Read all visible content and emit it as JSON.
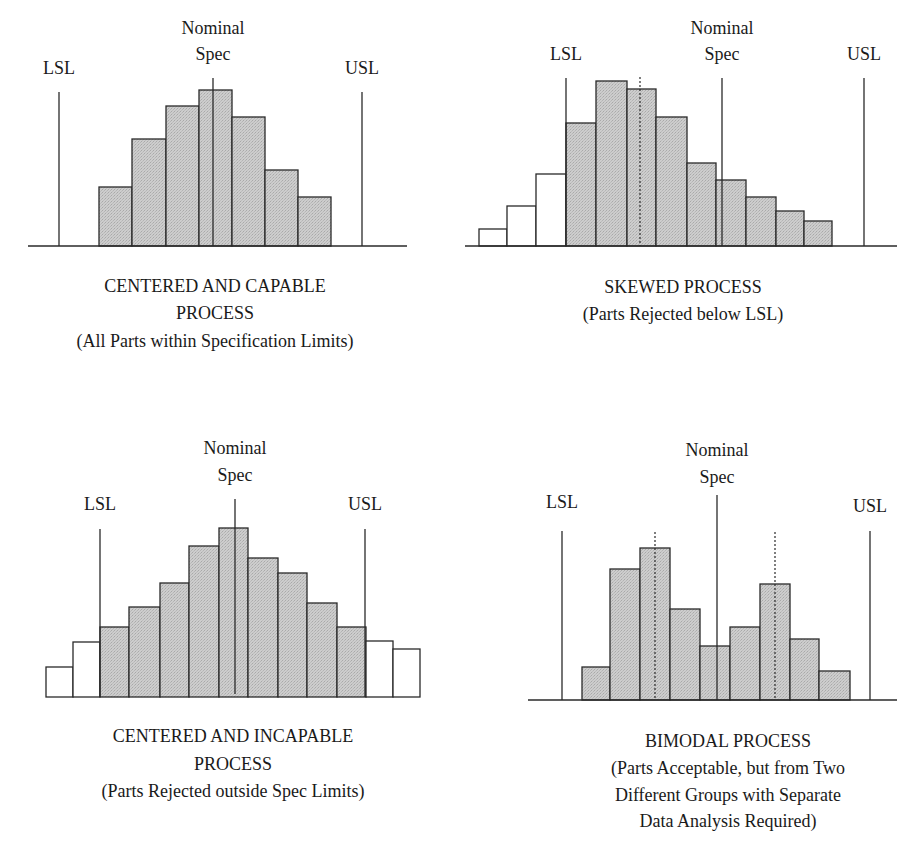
{
  "colors": {
    "fill_in_spec": "#c9c9c9",
    "fill_rejected": "#ffffff",
    "stroke": "#2a2a2a"
  },
  "labels": {
    "lsl": "LSL",
    "usl": "USL",
    "nominal_line1": "Nominal",
    "nominal_line2": "Spec"
  },
  "chart_data": [
    {
      "type": "bar",
      "title": "CENTERED AND CAPABLE PROCESS",
      "caption": [
        "CENTERED AND CAPABLE",
        "PROCESS",
        "(All Parts within Specification Limits)"
      ],
      "spec_lines": {
        "LSL": 59,
        "Nominal": 213,
        "USL": 362
      },
      "bars": [
        {
          "x0": 99,
          "x1": 132,
          "top": 187,
          "rejected": false
        },
        {
          "x0": 132,
          "x1": 166,
          "top": 139,
          "rejected": false
        },
        {
          "x0": 166,
          "x1": 199,
          "top": 106,
          "rejected": false
        },
        {
          "x0": 199,
          "x1": 232,
          "top": 90,
          "rejected": false
        },
        {
          "x0": 232,
          "x1": 265,
          "top": 117,
          "rejected": false
        },
        {
          "x0": 265,
          "x1": 298,
          "top": 170,
          "rejected": false
        },
        {
          "x0": 298,
          "x1": 331,
          "top": 197,
          "rejected": false
        }
      ],
      "relative_heights": [
        59,
        107,
        140,
        156,
        129,
        76,
        49
      ],
      "dotted_lines": []
    },
    {
      "type": "bar",
      "title": "SKEWED PROCESS",
      "caption": [
        "SKEWED PROCESS",
        "(Parts Rejected below LSL)"
      ],
      "spec_lines": {
        "LSL": 566,
        "Nominal": 722,
        "USL": 864
      },
      "bars": [
        {
          "x0": 479,
          "x1": 507,
          "top": 229,
          "rejected": true
        },
        {
          "x0": 507,
          "x1": 536,
          "top": 206,
          "rejected": true
        },
        {
          "x0": 536,
          "x1": 566,
          "top": 174,
          "rejected": true
        },
        {
          "x0": 566,
          "x1": 596,
          "top": 123,
          "rejected": false
        },
        {
          "x0": 596,
          "x1": 627,
          "top": 81,
          "rejected": false
        },
        {
          "x0": 627,
          "x1": 656,
          "top": 89,
          "rejected": false
        },
        {
          "x0": 656,
          "x1": 687,
          "top": 117,
          "rejected": false
        },
        {
          "x0": 687,
          "x1": 716,
          "top": 163,
          "rejected": false
        },
        {
          "x0": 716,
          "x1": 746,
          "top": 180,
          "rejected": false
        },
        {
          "x0": 746,
          "x1": 776,
          "top": 197,
          "rejected": false
        },
        {
          "x0": 776,
          "x1": 804,
          "top": 211,
          "rejected": false
        },
        {
          "x0": 804,
          "x1": 832,
          "top": 221,
          "rejected": false
        }
      ],
      "relative_heights": [
        17,
        40,
        72,
        123,
        165,
        157,
        129,
        83,
        66,
        49,
        35,
        25
      ],
      "dotted_lines": [
        640
      ]
    },
    {
      "type": "bar",
      "title": "CENTERED AND INCAPABLE PROCESS",
      "caption": [
        "CENTERED AND INCAPABLE",
        "PROCESS",
        "(Parts Rejected outside Spec Limits)"
      ],
      "spec_lines": {
        "LSL": 100,
        "Nominal": 235,
        "USL": 365
      },
      "bars": [
        {
          "x0": 46,
          "x1": 73,
          "top": 667,
          "rejected": true
        },
        {
          "x0": 73,
          "x1": 100,
          "top": 642,
          "rejected": true
        },
        {
          "x0": 100,
          "x1": 129,
          "top": 627,
          "rejected": false
        },
        {
          "x0": 129,
          "x1": 160,
          "top": 607,
          "rejected": false
        },
        {
          "x0": 160,
          "x1": 189,
          "top": 583,
          "rejected": false
        },
        {
          "x0": 189,
          "x1": 219,
          "top": 546,
          "rejected": false
        },
        {
          "x0": 219,
          "x1": 248,
          "top": 528,
          "rejected": false
        },
        {
          "x0": 248,
          "x1": 278,
          "top": 558,
          "rejected": false
        },
        {
          "x0": 278,
          "x1": 307,
          "top": 573,
          "rejected": false
        },
        {
          "x0": 307,
          "x1": 337,
          "top": 603,
          "rejected": false
        },
        {
          "x0": 337,
          "x1": 366,
          "top": 627,
          "rejected": false
        },
        {
          "x0": 366,
          "x1": 393,
          "top": 641,
          "rejected": true
        },
        {
          "x0": 393,
          "x1": 420,
          "top": 649,
          "rejected": true
        }
      ],
      "relative_heights": [
        30,
        55,
        70,
        90,
        114,
        151,
        169,
        139,
        124,
        94,
        70,
        56,
        48
      ],
      "dotted_lines": []
    },
    {
      "type": "bar",
      "title": "BIMODAL PROCESS",
      "caption": [
        "BIMODAL PROCESS",
        "(Parts Acceptable, but from Two",
        "Different Groups with Separate",
        "Data Analysis Required)"
      ],
      "spec_lines": {
        "LSL": 562,
        "Nominal": 717,
        "USL": 870
      },
      "bars": [
        {
          "x0": 582,
          "x1": 610,
          "top": 667,
          "rejected": false
        },
        {
          "x0": 610,
          "x1": 640,
          "top": 569,
          "rejected": false
        },
        {
          "x0": 640,
          "x1": 670,
          "top": 548,
          "rejected": false
        },
        {
          "x0": 670,
          "x1": 700,
          "top": 609,
          "rejected": false
        },
        {
          "x0": 700,
          "x1": 730,
          "top": 646,
          "rejected": false
        },
        {
          "x0": 730,
          "x1": 760,
          "top": 627,
          "rejected": false
        },
        {
          "x0": 760,
          "x1": 790,
          "top": 584,
          "rejected": false
        },
        {
          "x0": 790,
          "x1": 819,
          "top": 639,
          "rejected": false
        },
        {
          "x0": 819,
          "x1": 850,
          "top": 671,
          "rejected": false
        }
      ],
      "relative_heights": [
        33,
        131,
        152,
        91,
        54,
        73,
        116,
        61,
        29
      ],
      "dotted_lines": [
        655,
        775
      ]
    }
  ]
}
